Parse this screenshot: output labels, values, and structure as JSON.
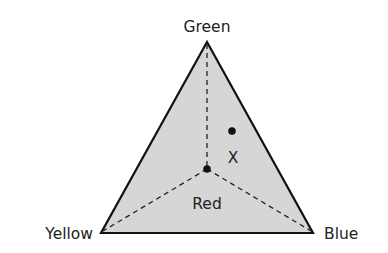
{
  "diagram": {
    "type": "ternary-triangle",
    "fill_color": "#d6d6d6",
    "stroke_color": "#111111",
    "vertices": {
      "top": {
        "label": "Green",
        "x": 207,
        "y": 42
      },
      "bottom_left": {
        "label": "Yellow",
        "x": 101,
        "y": 233
      },
      "bottom_right": {
        "label": "Blue",
        "x": 313,
        "y": 233
      }
    },
    "center_point": {
      "x": 207,
      "y": 169
    },
    "points": [
      {
        "label": "X",
        "x": 232,
        "y": 131,
        "label_x": 233,
        "label_y": 163
      }
    ],
    "region_label": {
      "text": "Red",
      "x": 207,
      "y": 209
    }
  }
}
